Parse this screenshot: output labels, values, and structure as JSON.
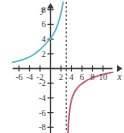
{
  "figure": {
    "kind": "cartesian-graph",
    "width": 124,
    "height": 133,
    "background": "#ffffff"
  },
  "chart_data": {
    "type": "line",
    "title": "",
    "xlabel": "x",
    "ylabel": "y",
    "xlim": [
      -7.2,
      11.8
    ],
    "ylim": [
      -9.4,
      9.0
    ],
    "grid": false,
    "legend": "none",
    "axis_color": "#3b3b3b",
    "x_ticks": [
      -6,
      -4,
      -2,
      2,
      4,
      6,
      8,
      10
    ],
    "x_tick_labels": [
      "-6",
      "-4",
      "-2",
      "2",
      "4",
      "6",
      "8",
      "10"
    ],
    "y_ticks": [
      8,
      6,
      4,
      2,
      -2,
      -4,
      -6,
      -8
    ],
    "y_tick_labels": [
      "8",
      "6",
      "4",
      "2",
      "-2",
      "-4",
      "-6",
      "-8"
    ],
    "annotations": [
      {
        "name": "vertical-asymptote",
        "kind": "dashed-vertical-line",
        "x": 3,
        "color": "#3b3b3b",
        "dash": "2,2.2"
      }
    ],
    "series": [
      {
        "name": "blue-curve",
        "color": "#5fb4d6",
        "width": 1.6,
        "description": "increasing exponential-like curve rising toward the asymptote from the left",
        "points": [
          [
            -7.2,
            0.85
          ],
          [
            -6.5,
            0.95
          ],
          [
            -6.0,
            1.05
          ],
          [
            -5.5,
            1.15
          ],
          [
            -5.0,
            1.28
          ],
          [
            -4.5,
            1.42
          ],
          [
            -4.0,
            1.58
          ],
          [
            -3.5,
            1.78
          ],
          [
            -3.0,
            2.0
          ],
          [
            -2.5,
            2.28
          ],
          [
            -2.0,
            2.58
          ],
          [
            -1.5,
            2.92
          ],
          [
            -1.0,
            3.3
          ],
          [
            -0.5,
            3.7
          ],
          [
            0.0,
            4.05
          ],
          [
            0.25,
            4.35
          ],
          [
            0.5,
            4.62
          ],
          [
            0.75,
            4.95
          ],
          [
            1.0,
            5.3
          ],
          [
            1.25,
            5.75
          ],
          [
            1.5,
            6.25
          ],
          [
            1.75,
            6.85
          ],
          [
            2.0,
            7.55
          ],
          [
            2.15,
            8.05
          ],
          [
            2.3,
            8.6
          ],
          [
            2.4,
            9.0
          ]
        ]
      },
      {
        "name": "pink-curve",
        "color": "#d2566e",
        "width": 1.6,
        "description": "branch in the fourth quadrant rising from the vertical asymptote toward the x-axis",
        "points": [
          [
            3.28,
            -9.4
          ],
          [
            3.35,
            -8.4
          ],
          [
            3.42,
            -7.5
          ],
          [
            3.5,
            -6.75
          ],
          [
            3.6,
            -6.0
          ],
          [
            3.75,
            -5.2
          ],
          [
            3.9,
            -4.6
          ],
          [
            4.1,
            -4.05
          ],
          [
            4.35,
            -3.55
          ],
          [
            4.6,
            -3.18
          ],
          [
            4.9,
            -2.85
          ],
          [
            5.2,
            -2.58
          ],
          [
            5.6,
            -2.28
          ],
          [
            6.0,
            -2.05
          ],
          [
            6.5,
            -1.8
          ],
          [
            7.0,
            -1.58
          ],
          [
            7.6,
            -1.38
          ],
          [
            8.2,
            -1.2
          ],
          [
            8.8,
            -1.05
          ],
          [
            9.4,
            -0.92
          ],
          [
            10.0,
            -0.8
          ],
          [
            10.6,
            -0.7
          ],
          [
            11.2,
            -0.6
          ],
          [
            11.8,
            -0.52
          ]
        ]
      }
    ]
  },
  "labels": {
    "y_axis_label": "y",
    "x_axis_label": "x"
  }
}
